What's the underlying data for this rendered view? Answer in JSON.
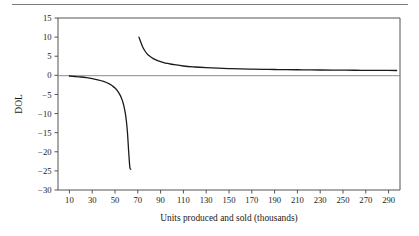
{
  "figure": {
    "top_rule": true,
    "background_color": "#ffffff",
    "line_color": "#1a1a1a",
    "axis_color": "#555555"
  },
  "chart_data": {
    "type": "line",
    "title": "",
    "subtitle": "",
    "xlabel": "Units produced and sold (thousands)",
    "ylabel": "DOL",
    "xlim": [
      0,
      300
    ],
    "ylim": [
      -30,
      15
    ],
    "grid": false,
    "legend": null,
    "xticks": [
      10,
      30,
      50,
      70,
      90,
      110,
      130,
      150,
      170,
      190,
      210,
      230,
      250,
      270,
      290
    ],
    "xtick_labels": [
      "10",
      "30",
      "50",
      "70",
      "90",
      "110",
      "130",
      "150",
      "170",
      "190",
      "210",
      "230",
      "250",
      "270",
      "290"
    ],
    "yticks": [
      15,
      10,
      5,
      0,
      -5,
      -10,
      -15,
      -20,
      -25,
      -30
    ],
    "ytick_labels": [
      "15",
      "10",
      "5",
      "0",
      "−5",
      "−10",
      "−15",
      "−20",
      "−25",
      "−30"
    ],
    "zero_line": 0,
    "asymptote_x": 65,
    "series": [
      {
        "name": "DOL (below break-even)",
        "x": [
          10,
          15,
          20,
          25,
          30,
          35,
          40,
          45,
          48,
          50,
          52,
          54,
          55,
          56,
          57,
          58,
          59,
          60,
          61,
          62,
          63,
          63.8
        ],
        "y": [
          -0.18,
          -0.3,
          -0.44,
          -0.62,
          -0.86,
          -1.17,
          -1.6,
          -2.25,
          -2.82,
          -3.33,
          -4.0,
          -4.91,
          -5.5,
          -6.22,
          -7.11,
          -8.29,
          -9.83,
          -12.0,
          -15.2,
          -20.0,
          -24.0,
          -24.6
        ]
      },
      {
        "name": "DOL (above break-even)",
        "x": [
          71,
          72,
          74,
          76,
          78,
          80,
          84,
          88,
          92,
          96,
          100,
          110,
          120,
          130,
          140,
          150,
          160,
          170,
          180,
          190,
          200,
          215,
          230,
          245,
          260,
          275,
          290,
          297
        ],
        "y": [
          10.0,
          9.2,
          7.6,
          6.5,
          5.7,
          5.1,
          4.3,
          3.8,
          3.4,
          3.1,
          2.9,
          2.44,
          2.18,
          2.0,
          1.87,
          1.77,
          1.68,
          1.62,
          1.57,
          1.53,
          1.49,
          1.44,
          1.39,
          1.36,
          1.33,
          1.31,
          1.28,
          1.27
        ]
      }
    ]
  }
}
